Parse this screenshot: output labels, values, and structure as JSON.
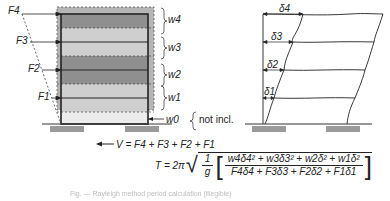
{
  "left_diagram": {
    "forces": [
      "F4",
      "F3",
      "F2",
      "F1"
    ],
    "weights": [
      "w4",
      "w3",
      "w2",
      "w1",
      "w0"
    ],
    "note": "not incl.",
    "base_shear": "V = F4 + F3 + F2 + F1"
  },
  "right_diagram": {
    "displacements": [
      "δ4",
      "δ3",
      "δ2",
      "δ1"
    ]
  },
  "formula": {
    "lhs": "T = 2π",
    "inv_g_num": "1",
    "inv_g_den": "g",
    "numerator": "w4δ4² + w3δ3² + w2δ² + w1δ²",
    "denominator": "F4δ4 + F3δ3 + F2δ2 + F1δ1"
  },
  "caption": "Fig. — Rayleigh method period calculation (illegible)",
  "colors": {
    "dark_band": "#8f8f8f",
    "light_band": "#cfcfcf",
    "outer_shade": "#b5b5b5",
    "footing": "#9a9a9a",
    "line": "#222222"
  }
}
